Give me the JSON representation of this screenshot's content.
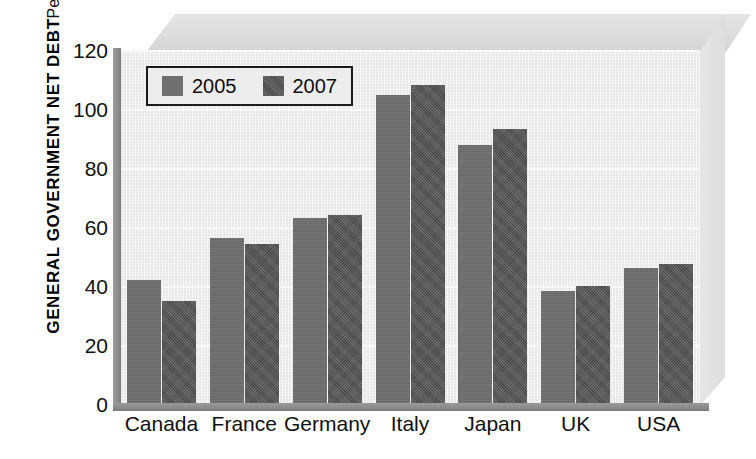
{
  "chart_data": {
    "type": "bar",
    "title": "",
    "ylabel": "GENERAL GOVERNMENT NET DEBT",
    "ylabel_sub": "Percent of GDP",
    "xlabel": "",
    "ylim": [
      0,
      120
    ],
    "yticks": [
      0,
      20,
      40,
      60,
      80,
      100,
      120
    ],
    "ytick_labels": [
      "0",
      "20",
      "40",
      "60",
      "80",
      "100",
      "120"
    ],
    "grid": true,
    "legend_position": "upper-left",
    "categories": [
      "Canada",
      "France",
      "Germany",
      "Italy",
      "Japan",
      "UK",
      "USA"
    ],
    "series": [
      {
        "name": "2005",
        "color": "#6f6f6f",
        "values": [
          42.4,
          56.5,
          63.5,
          105.0,
          88.0,
          38.5,
          46.5
        ]
      },
      {
        "name": "2007",
        "color": "#545454",
        "values": [
          35.3,
          54.5,
          64.3,
          108.5,
          93.5,
          40.5,
          47.7
        ]
      }
    ]
  },
  "legend": {
    "entries": [
      {
        "label": "2005",
        "swatch": "legend-swatch-2005"
      },
      {
        "label": "2007",
        "swatch": "legend-swatch-2007"
      }
    ]
  },
  "colors": {
    "series_2005": "#6f6f6f",
    "series_2007": "#545454",
    "panel_background": "#ededed",
    "box_face": "#dcdcdc",
    "axis": "#8a8a8a",
    "text": "#101010"
  }
}
